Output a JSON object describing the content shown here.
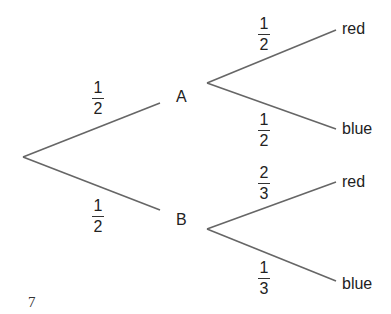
{
  "diagram": {
    "type": "probability-tree",
    "line_color": "#666666",
    "first_stage": {
      "branches": [
        {
          "outcome": "A",
          "probability": {
            "numerator": "1",
            "denominator": "2"
          }
        },
        {
          "outcome": "B",
          "probability": {
            "numerator": "1",
            "denominator": "2"
          }
        }
      ]
    },
    "second_stage": {
      "A": [
        {
          "outcome": "red",
          "probability": {
            "numerator": "1",
            "denominator": "2"
          }
        },
        {
          "outcome": "blue",
          "probability": {
            "numerator": "1",
            "denominator": "2"
          }
        }
      ],
      "B": [
        {
          "outcome": "red",
          "probability": {
            "numerator": "2",
            "denominator": "3"
          }
        },
        {
          "outcome": "blue",
          "probability": {
            "numerator": "1",
            "denominator": "3"
          }
        }
      ]
    }
  },
  "page_number": "7"
}
